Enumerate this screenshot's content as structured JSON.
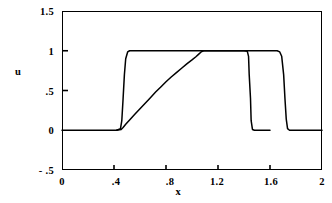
{
  "chart_data": {
    "type": "line",
    "title": "",
    "xlabel": "x",
    "ylabel": "u",
    "xlim": [
      0,
      2
    ],
    "ylim": [
      -0.5,
      1.5
    ],
    "xticks": [
      0,
      0.4,
      0.8,
      1.2,
      1.6,
      2
    ],
    "xticklabels": [
      "0",
      ".4",
      ".8",
      "1.2",
      "1.6",
      "2"
    ],
    "yticks": [
      -0.5,
      0,
      0.5,
      1,
      1.5
    ],
    "yticklabels": [
      "- .5",
      "0",
      ".5",
      "1",
      "1.5"
    ],
    "grid": false,
    "legend": false,
    "line_color": "#000000",
    "series": [
      {
        "name": "square-wave",
        "description": "sharp square pulse, near-vertical rise and fall",
        "points": [
          [
            0.0,
            0.0
          ],
          [
            0.42,
            0.0
          ],
          [
            0.45,
            0.02
          ],
          [
            0.46,
            0.12
          ],
          [
            0.47,
            0.4
          ],
          [
            0.48,
            0.7
          ],
          [
            0.49,
            0.9
          ],
          [
            0.505,
            0.985
          ],
          [
            0.52,
            1.0
          ],
          [
            0.56,
            1.0
          ],
          [
            0.8,
            1.0
          ],
          [
            1.0,
            1.0
          ],
          [
            1.2,
            1.0
          ],
          [
            1.4,
            1.0
          ],
          [
            1.6,
            1.0
          ],
          [
            1.655,
            1.0
          ],
          [
            1.675,
            0.985
          ],
          [
            1.69,
            0.93
          ],
          [
            1.705,
            0.7
          ],
          [
            1.715,
            0.4
          ],
          [
            1.725,
            0.14
          ],
          [
            1.735,
            0.02
          ],
          [
            1.75,
            0.0
          ],
          [
            2.0,
            0.0
          ]
        ]
      },
      {
        "name": "smeared-solution",
        "description": "diffused pulse with gradual linear ramp up and steep drop",
        "points": [
          [
            0.42,
            0.0
          ],
          [
            0.455,
            0.01
          ],
          [
            0.47,
            0.035
          ],
          [
            0.49,
            0.075
          ],
          [
            0.52,
            0.13
          ],
          [
            0.56,
            0.2
          ],
          [
            0.6,
            0.27
          ],
          [
            0.64,
            0.34
          ],
          [
            0.68,
            0.41
          ],
          [
            0.72,
            0.48
          ],
          [
            0.76,
            0.545
          ],
          [
            0.8,
            0.61
          ],
          [
            0.84,
            0.67
          ],
          [
            0.88,
            0.725
          ],
          [
            0.92,
            0.78
          ],
          [
            0.96,
            0.835
          ],
          [
            1.0,
            0.885
          ],
          [
            1.03,
            0.925
          ],
          [
            1.05,
            0.955
          ],
          [
            1.07,
            0.985
          ],
          [
            1.09,
            1.0
          ],
          [
            1.2,
            1.0
          ],
          [
            1.3,
            1.0
          ],
          [
            1.4,
            1.0
          ],
          [
            1.425,
            0.995
          ],
          [
            1.435,
            0.93
          ],
          [
            1.44,
            0.7
          ],
          [
            1.45,
            0.4
          ],
          [
            1.455,
            0.12
          ],
          [
            1.465,
            0.01
          ],
          [
            1.48,
            0.0
          ],
          [
            1.6,
            0.0
          ]
        ]
      }
    ]
  },
  "axis": {
    "y_label": "u",
    "x_label": "x",
    "y_tick_labels": [
      "1.5",
      "1",
      ".5",
      "0",
      "- .5"
    ],
    "x_tick_labels": [
      "0",
      ".4",
      ".8",
      "1.2",
      "1.6",
      "2"
    ]
  }
}
